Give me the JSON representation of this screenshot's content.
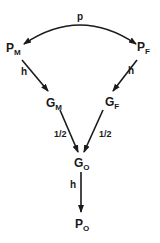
{
  "diagram": {
    "type": "path-diagram",
    "nodes": {
      "pm": {
        "main": "P",
        "sub": "M"
      },
      "pf": {
        "main": "P",
        "sub": "F"
      },
      "gm": {
        "main": "G",
        "sub": "M"
      },
      "gf": {
        "main": "G",
        "sub": "F"
      },
      "go": {
        "main": "G",
        "sub": "O"
      },
      "po": {
        "main": "P",
        "sub": "O"
      }
    },
    "edges": {
      "pm_pf": {
        "from": "PM",
        "to": "PF",
        "label": "p",
        "bidirectional": true
      },
      "pm_gm": {
        "from": "PM",
        "to": "GM",
        "label": "h"
      },
      "pf_gf": {
        "from": "PF",
        "to": "GF",
        "label": "h"
      },
      "gm_go": {
        "from": "GM",
        "to": "GO",
        "label": "1/2"
      },
      "gf_go": {
        "from": "GF",
        "to": "GO",
        "label": "1/2"
      },
      "go_po": {
        "from": "GO",
        "to": "PO",
        "label": "h"
      }
    },
    "colors": {
      "ink": "#1a1a1a",
      "background": "#ffffff"
    }
  }
}
